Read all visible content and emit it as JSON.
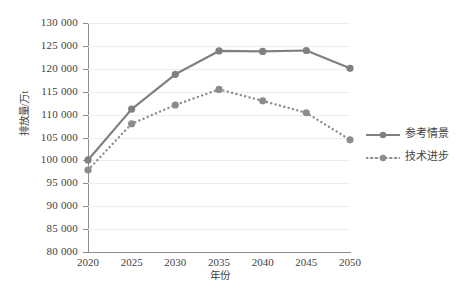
{
  "chart_data": {
    "type": "line",
    "title": "",
    "xlabel": "年份",
    "ylabel": "排放量/万t",
    "x": [
      2020,
      2025,
      2030,
      2035,
      2040,
      2045,
      2050
    ],
    "xtick_labels": [
      "2020",
      "2025",
      "2030",
      "2035",
      "2040",
      "2045",
      "2050"
    ],
    "ytick_labels": [
      "80 000",
      "85 000",
      "90 000",
      "95 000",
      "100 000",
      "105 000",
      "110 000",
      "115 000",
      "120 000",
      "125 000",
      "130 000"
    ],
    "yticks": [
      80000,
      85000,
      90000,
      95000,
      100000,
      105000,
      110000,
      115000,
      120000,
      125000,
      130000
    ],
    "ylim": [
      80000,
      130000
    ],
    "xlim": [
      2020,
      2050
    ],
    "grid": true,
    "grid_axis": "y",
    "legend_position": "right",
    "series": [
      {
        "name": "参考情景",
        "style": "solid",
        "color": "#808080",
        "marker": "circle",
        "values": [
          100100,
          111200,
          118800,
          123900,
          123800,
          124000,
          120100
        ]
      },
      {
        "name": "技术进步",
        "style": "dotted",
        "color": "#8c8c8c",
        "marker": "circle",
        "values": [
          97900,
          108000,
          112100,
          115500,
          113000,
          110400,
          104500
        ]
      }
    ]
  },
  "legend": {
    "items": [
      {
        "label": "参考情景",
        "style": "solid"
      },
      {
        "label": "技术进步",
        "style": "dotted"
      }
    ]
  },
  "colors": {
    "series_primary": "#808080",
    "series_secondary": "#8c8c8c",
    "gridline": "#ececec",
    "axis": "#8c8c8c",
    "text": "#3f3f3f",
    "background": "#ffffff"
  }
}
